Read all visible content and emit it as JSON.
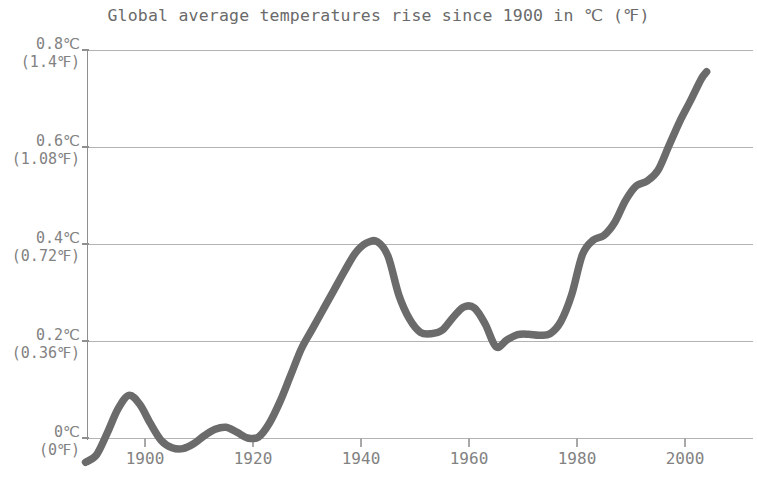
{
  "chart_data": {
    "type": "line",
    "title": "Global average temperatures rise since 1900 in ℃ (℉)",
    "xlabel": "",
    "ylabel": "",
    "xlim": [
      1889,
      2012
    ],
    "ylim": [
      -0.1,
      0.8
    ],
    "grid": true,
    "legend": "none",
    "line_color": "#6b6b6b",
    "grid_color": "#b3b3b3",
    "axis_color": "#8f8f8f",
    "text_color": "#828282",
    "y_ticks": [
      {
        "value": 0.8,
        "celsius": "0.8℃",
        "fahrenheit": "(1.4℉)"
      },
      {
        "value": 0.6,
        "celsius": "0.6℃",
        "fahrenheit": "(1.08℉)"
      },
      {
        "value": 0.4,
        "celsius": "0.4℃",
        "fahrenheit": "(0.72℉)"
      },
      {
        "value": 0.2,
        "celsius": "0.2℃",
        "fahrenheit": "(0.36℉)"
      },
      {
        "value": 0.0,
        "celsius": "0℃",
        "fahrenheit": "(0℉)"
      }
    ],
    "x_ticks": [
      {
        "value": 1900,
        "label": "1900"
      },
      {
        "value": 1920,
        "label": "1920"
      },
      {
        "value": 1940,
        "label": "1940"
      },
      {
        "value": 1960,
        "label": "1960"
      },
      {
        "value": 1980,
        "label": "1980"
      },
      {
        "value": 2000,
        "label": "2000"
      }
    ],
    "series": [
      {
        "name": "Global average temperature anomaly",
        "x": [
          1889,
          1891,
          1893,
          1895,
          1897,
          1899,
          1901,
          1903,
          1905,
          1907,
          1909,
          1911,
          1913,
          1915,
          1917,
          1919,
          1921,
          1923,
          1925,
          1927,
          1929,
          1931,
          1933,
          1935,
          1937,
          1939,
          1941,
          1943,
          1945,
          1947,
          1949,
          1951,
          1953,
          1955,
          1957,
          1959,
          1961,
          1963,
          1965,
          1967,
          1969,
          1971,
          1973,
          1975,
          1977,
          1979,
          1981,
          1983,
          1985,
          1987,
          1989,
          1991,
          1993,
          1995,
          1997,
          1999,
          2001,
          2003,
          2004
        ],
        "y": [
          -0.05,
          -0.035,
          0.01,
          0.06,
          0.088,
          0.07,
          0.03,
          -0.005,
          -0.02,
          -0.022,
          -0.012,
          0.005,
          0.018,
          0.022,
          0.012,
          0.0,
          0.002,
          0.03,
          0.075,
          0.13,
          0.185,
          0.225,
          0.265,
          0.305,
          0.345,
          0.382,
          0.402,
          0.405,
          0.375,
          0.295,
          0.245,
          0.218,
          0.215,
          0.222,
          0.248,
          0.27,
          0.268,
          0.235,
          0.188,
          0.202,
          0.213,
          0.214,
          0.212,
          0.215,
          0.24,
          0.295,
          0.378,
          0.408,
          0.418,
          0.445,
          0.49,
          0.52,
          0.53,
          0.552,
          0.602,
          0.652,
          0.695,
          0.74,
          0.755
        ]
      }
    ]
  }
}
